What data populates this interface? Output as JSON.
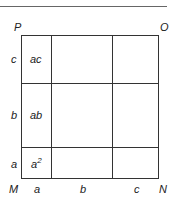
{
  "diagram": {
    "corners": {
      "top_left": "P",
      "top_right": "O",
      "bottom_left": "M",
      "bottom_right": "N"
    },
    "bottom_labels": [
      "a",
      "b",
      "c"
    ],
    "left_labels": [
      "c",
      "b",
      "a"
    ],
    "cells": {
      "top_left": "ac",
      "middle_left": "ab",
      "bottom_left_base": "a",
      "bottom_left_exp": "2"
    },
    "colors": {
      "line": "#333333",
      "text": "#222222",
      "rule": "#666666",
      "background": "#ffffff"
    }
  }
}
